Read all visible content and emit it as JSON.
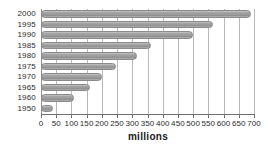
{
  "chart_data": {
    "type": "bar",
    "orientation": "horizontal",
    "title": "",
    "xlabel": "millions",
    "ylabel": "",
    "xlim": [
      0,
      700
    ],
    "ylim": null,
    "grid": true,
    "legend": null,
    "xticks": [
      0,
      50,
      100,
      150,
      200,
      250,
      300,
      350,
      400,
      450,
      500,
      550,
      600,
      650,
      700
    ],
    "categories": [
      "2000",
      "1995",
      "1990",
      "1985",
      "1980",
      "1975",
      "1970",
      "1965",
      "1960",
      "1950"
    ],
    "values": [
      690,
      565,
      500,
      360,
      315,
      245,
      200,
      160,
      110,
      40
    ],
    "series": [
      {
        "name": "millions",
        "values": [
          690,
          565,
          500,
          360,
          315,
          245,
          200,
          160,
          110,
          40
        ]
      }
    ],
    "bar_color": "#9b9b9b",
    "grid_color": "#b9b9b9",
    "axis_color": "#6f6f6f",
    "text_color": "#2b2b2b"
  }
}
